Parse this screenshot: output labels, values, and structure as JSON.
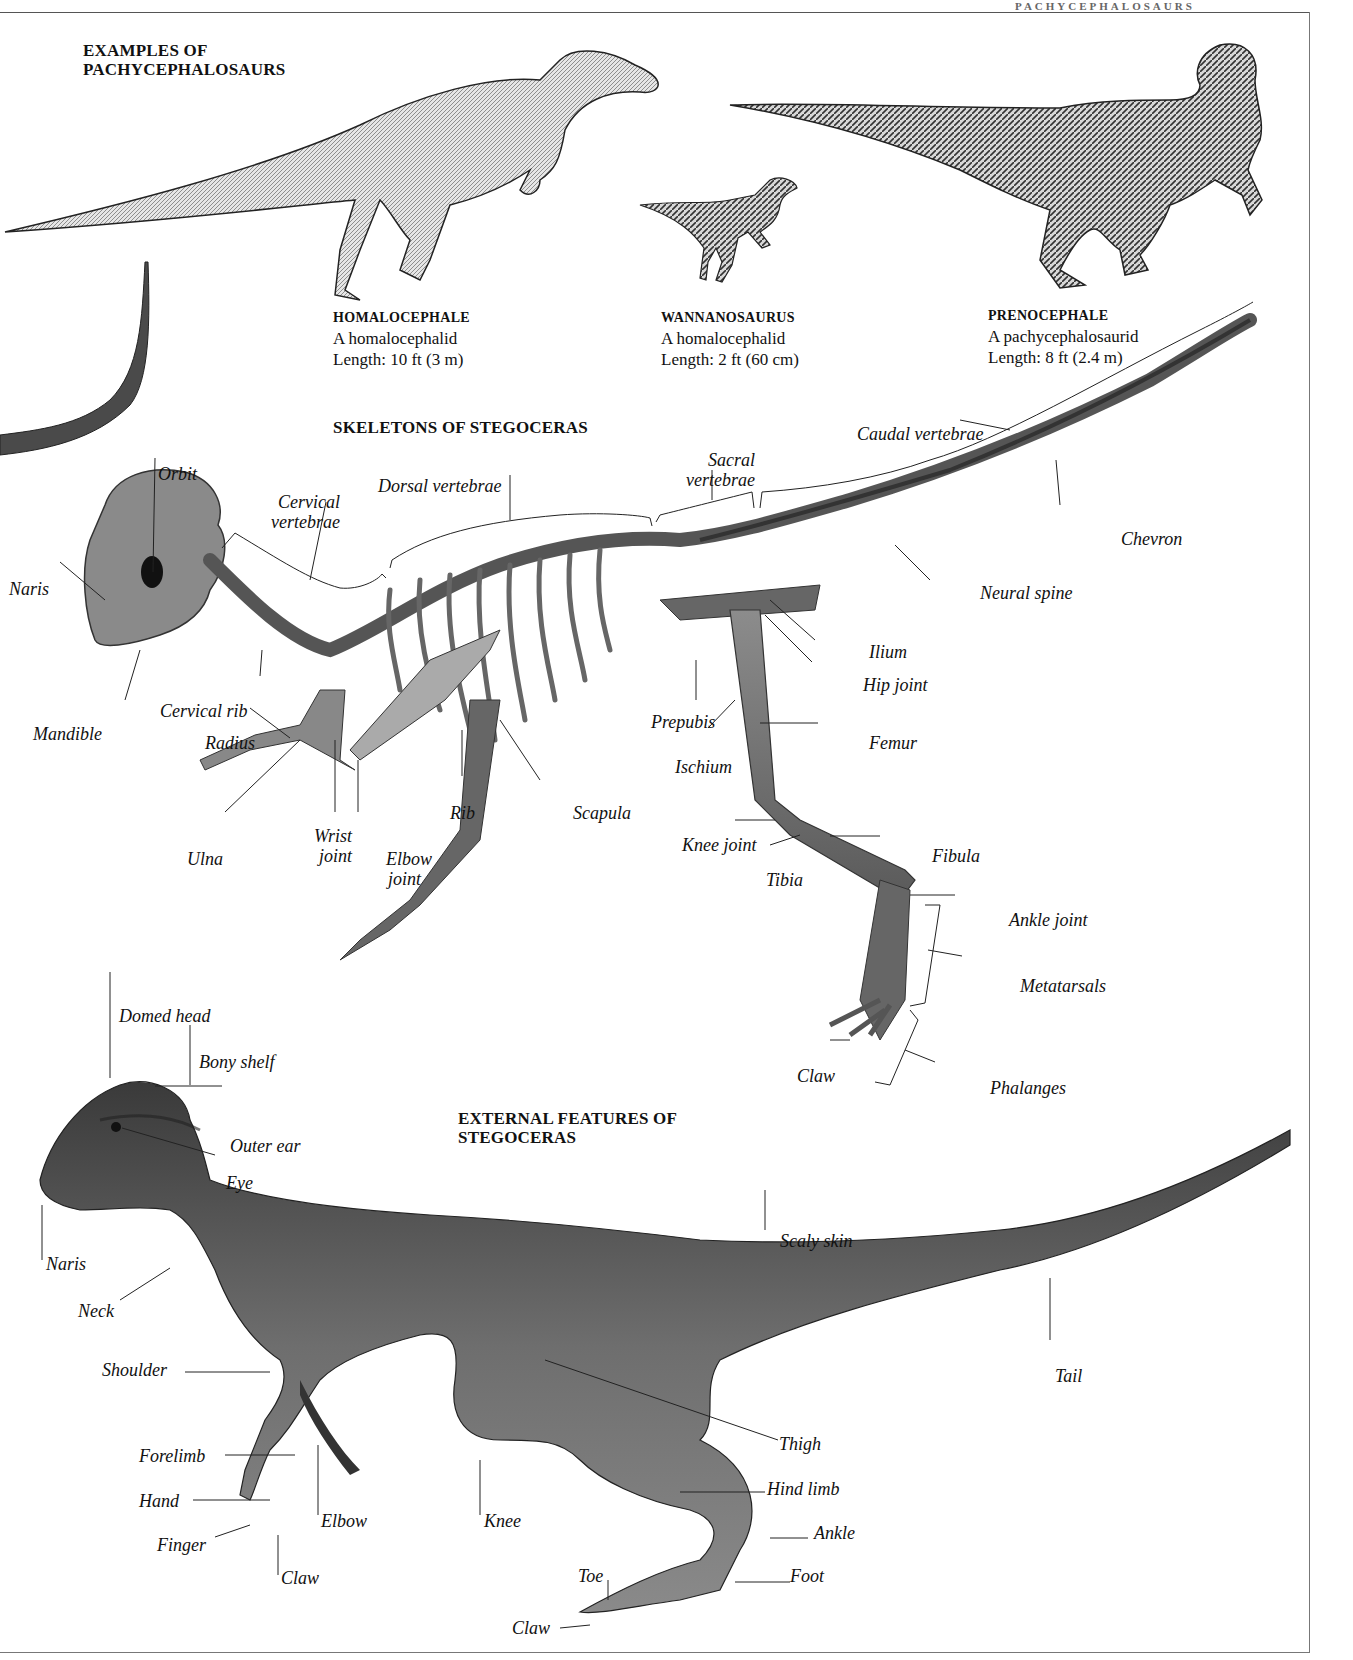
{
  "running_head": "PACHYCEPHALOSAURS",
  "sections": {
    "examples_title_line1": "EXAMPLES OF",
    "examples_title_line2": "PACHYCEPHALOSAURS",
    "skeleton_title": "SKELETONS OF STEGOCERAS",
    "external_title_line1": "EXTERNAL FEATURES OF",
    "external_title_line2": "STEGOCERAS"
  },
  "examples": [
    {
      "name": "HOMALOCEPHALE",
      "type": "A homalocephalid",
      "length": "Length: 10 ft (3 m)"
    },
    {
      "name": "WANNANOSAURUS",
      "type": "A homalocephalid",
      "length": "Length: 2 ft (60 cm)"
    },
    {
      "name": "PRENOCEPHALE",
      "type": "A pachycephalosaurid",
      "length": "Length: 8 ft (2.4 m)"
    }
  ],
  "skeleton_labels": {
    "orbit": "Orbit",
    "cervical_vertebrae_1": "Cervical",
    "cervical_vertebrae_2": "vertebrae",
    "dorsal_vertebrae": "Dorsal vertebrae",
    "sacral_vertebrae_1": "Sacral",
    "sacral_vertebrae_2": "vertebrae",
    "caudal_vertebrae": "Caudal vertebrae",
    "chevron": "Chevron",
    "neural_spine": "Neural spine",
    "naris": "Naris",
    "ilium": "Ilium",
    "hip_joint": "Hip joint",
    "cervical_rib": "Cervical rib",
    "mandible": "Mandible",
    "prepubis": "Prepubis",
    "femur": "Femur",
    "radius": "Radius",
    "ischium": "Ischium",
    "rib": "Rib",
    "scapula": "Scapula",
    "wrist_joint_1": "Wrist",
    "wrist_joint_2": "joint",
    "elbow_joint_1": "Elbow",
    "elbow_joint_2": "joint",
    "ulna": "Ulna",
    "knee_joint": "Knee joint",
    "fibula": "Fibula",
    "tibia": "Tibia",
    "ankle_joint": "Ankle joint",
    "metatarsals": "Metatarsals",
    "claw": "Claw",
    "phalanges": "Phalanges"
  },
  "external_labels": {
    "domed_head": "Domed head",
    "bony_shelf": "Bony shelf",
    "outer_ear": "Outer ear",
    "eye": "Eye",
    "naris": "Naris",
    "neck": "Neck",
    "scaly_skin": "Scaly skin",
    "shoulder": "Shoulder",
    "tail": "Tail",
    "thigh": "Thigh",
    "forelimb": "Forelimb",
    "hind_limb": "Hind limb",
    "hand": "Hand",
    "elbow": "Elbow",
    "knee": "Knee",
    "ankle": "Ankle",
    "finger": "Finger",
    "claw": "Claw",
    "toe": "Toe",
    "foot": "Foot",
    "toe_claw": "Claw"
  }
}
